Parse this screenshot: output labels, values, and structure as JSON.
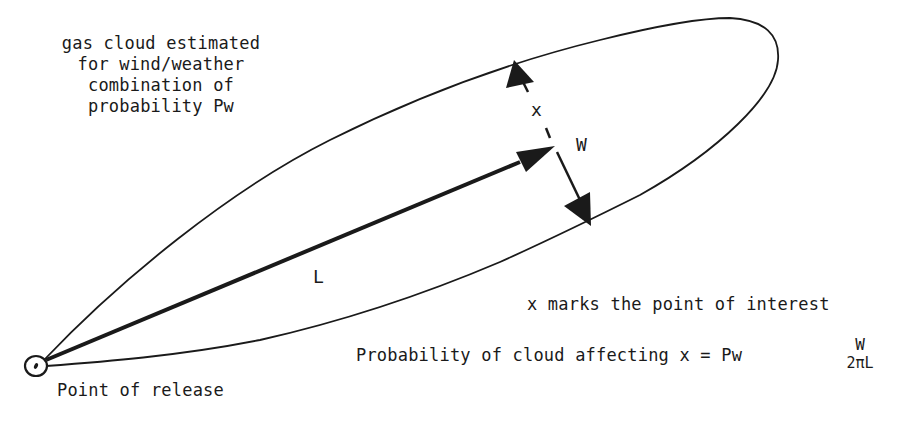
{
  "diagram": {
    "caption_lines": [
      "gas cloud estimated",
      "for wind/weather",
      "combination of",
      "probability Pw"
    ],
    "labels": {
      "x": "x",
      "w": "W",
      "l": "L",
      "point_of_release": "Point of release",
      "point_of_interest_note": "x marks the point of interest"
    },
    "formula": {
      "prefix": "Probability of cloud affecting x = Pw",
      "numerator": "W",
      "denominator": "2πL"
    },
    "colors": {
      "ink": "#1a1a1a",
      "background": "#ffffff"
    }
  }
}
